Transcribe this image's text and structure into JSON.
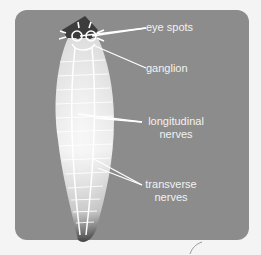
{
  "diagram": {
    "colors": {
      "background": "#f4f4f4",
      "panel": "#8c8c8c",
      "body_light": "#e8e8e8",
      "body_dark": "#3a3a3a",
      "nerve": "#ffffff",
      "label_text": "#f2f2f2"
    },
    "labels": {
      "eye_spots": "eye spots",
      "ganglion": "ganglion",
      "longitudinal_line1": "longitudinal",
      "longitudinal_line2": "nerves",
      "transverse_line1": "transverse",
      "transverse_line2": "nerves"
    }
  }
}
